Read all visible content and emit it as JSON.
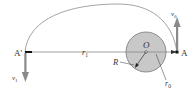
{
  "diagram": {
    "type": "orbital-transfer",
    "points": {
      "apogee_label": "A'",
      "perigee_label": "A",
      "center_label": "O"
    },
    "labels": {
      "r1": "r",
      "r1_sub": "1",
      "r0": "r",
      "r0_sub": "0",
      "R": "R",
      "v0": "v",
      "v0_sub": "0",
      "v1": "v",
      "v1_sub": "1"
    },
    "colors": {
      "planet_fill": "#c8c8c8",
      "planet_stroke": "#777777",
      "orbit_stroke": "#999999",
      "arrow_fill": "#8a8a8a",
      "line_stroke": "#888888"
    }
  }
}
